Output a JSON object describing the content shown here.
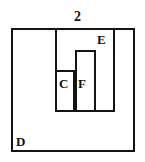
{
  "figure": {
    "type": "geometry-diagram",
    "background_color": "#ffffff",
    "stroke_color": "#141414",
    "text_color": "#111111",
    "labels": {
      "top_number": "2",
      "outer_region": "D",
      "inner_region": "E",
      "small_left_region": "C",
      "small_right_region": "F"
    },
    "regions": [
      {
        "name": "D",
        "label": "D",
        "role": "outermost-square",
        "x": 11,
        "y": 28,
        "width": 124,
        "height": 124
      },
      {
        "name": "E",
        "label": "E",
        "role": "inner-rectangle",
        "x": 55,
        "y": 28,
        "width": 60,
        "height": 84
      },
      {
        "name": "F",
        "label": "F",
        "role": "tall-narrow-rectangle",
        "x": 75,
        "y": 50,
        "width": 21,
        "height": 62
      },
      {
        "name": "C",
        "label": "C",
        "role": "short-narrow-rectangle",
        "x": 55,
        "y": 70,
        "width": 20,
        "height": 42
      }
    ]
  }
}
